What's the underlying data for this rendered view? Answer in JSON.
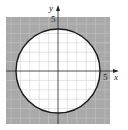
{
  "chart_data": {
    "type": "region",
    "title": "",
    "xlabel": "x",
    "ylabel": "y",
    "xlim": [
      -5.5,
      5.5
    ],
    "ylim": [
      -5.5,
      5.5
    ],
    "grid": true,
    "grid_step": 1,
    "tick_labels": {
      "x": [
        "5"
      ],
      "y": [
        "5"
      ]
    },
    "circle": {
      "center": [
        0,
        0
      ],
      "radius": 4.5,
      "boundary": "solid"
    },
    "shaded": "outside",
    "colors": {
      "shade": "#a9a9a9",
      "inside": "#ffffff",
      "boundary": "#1a1a1a",
      "grid": "#d0d0d0",
      "axis": "#222222"
    }
  },
  "labels": {
    "x_axis": "x",
    "y_axis": "y",
    "x_tick": "5",
    "y_tick": "5"
  }
}
